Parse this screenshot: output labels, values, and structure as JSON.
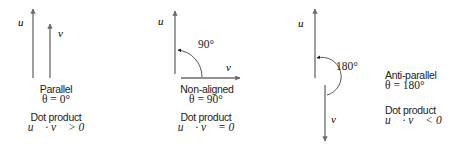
{
  "colors": {
    "arrow": "#6b6b6b",
    "text": "#222222",
    "background": "#ffffff"
  },
  "vectors": {
    "u": "u⃗",
    "v": "v⃗"
  },
  "panels": [
    {
      "id": "parallel",
      "title": "Parallel",
      "theta": "θ = 0°",
      "dot_label": "Dot product",
      "dot_expr": "u⃗ · v⃗  > 0"
    },
    {
      "id": "non-aligned",
      "title": "Non-aligned",
      "theta": "θ = 90°",
      "angle_label": "90°",
      "dot_label": "Dot product",
      "dot_expr": "u⃗ · v⃗  = 0"
    },
    {
      "id": "anti-parallel",
      "title": "Anti-parallel",
      "theta": "θ = 180°",
      "angle_label": "180°",
      "dot_label": "Dot product",
      "dot_expr": "u⃗ · v⃗  < 0"
    }
  ]
}
